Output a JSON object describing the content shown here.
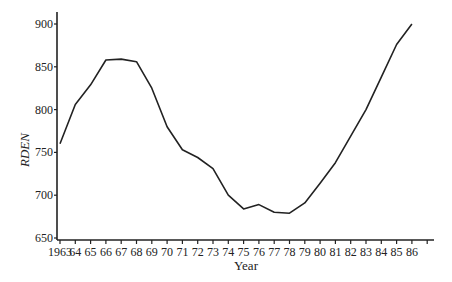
{
  "chart_data": {
    "type": "line",
    "title": "",
    "xlabel": "Year",
    "ylabel": "RDEN",
    "x": [
      1963,
      1964,
      1965,
      1966,
      1967,
      1968,
      1969,
      1970,
      1971,
      1972,
      1973,
      1974,
      1975,
      1976,
      1977,
      1978,
      1979,
      1980,
      1981,
      1982,
      1983,
      1984,
      1985,
      1986
    ],
    "x_tick_labels": [
      "1963",
      "64",
      "65",
      "66",
      "67",
      "68",
      "69",
      "70",
      "71",
      "72",
      "73",
      "74",
      "75",
      "76",
      "77",
      "78",
      "79",
      "80",
      "81",
      "82",
      "83",
      "84",
      "85",
      "86",
      ""
    ],
    "series": [
      {
        "name": "RDEN",
        "values": [
          760,
          806,
          829,
          858,
          859,
          856,
          825,
          780,
          753,
          744,
          731,
          700,
          684,
          689,
          680,
          679,
          691,
          714,
          738,
          769,
          800,
          838,
          876,
          900
        ]
      }
    ],
    "y_ticks": [
      650,
      700,
      750,
      800,
      850,
      900
    ],
    "ylim": [
      650,
      915
    ],
    "xlim": [
      1963,
      1987.5
    ],
    "grid": false,
    "legend": "none",
    "line_color": "#222222"
  }
}
